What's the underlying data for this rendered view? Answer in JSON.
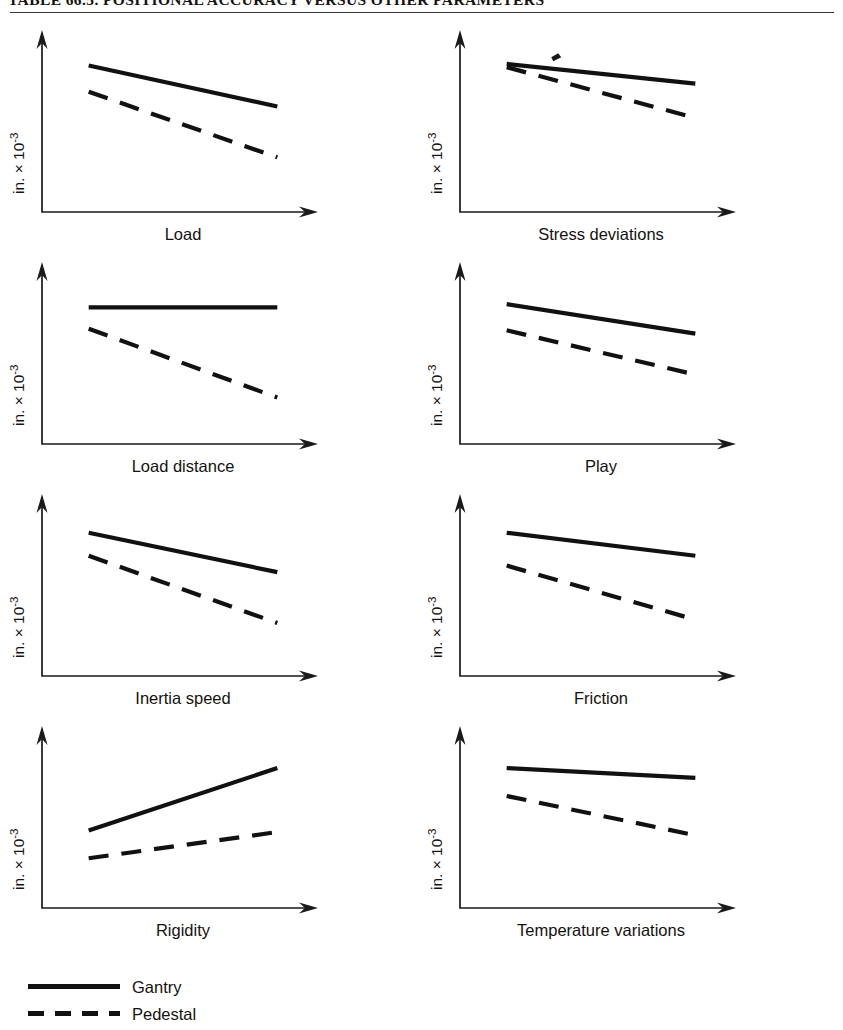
{
  "title": "TABLE 66.5.  POSITIONAL ACCURACY VERSUS OTHER PARAMETERS",
  "axis": {
    "ylabel": "in. × 10",
    "ylabel_exponent": "-3"
  },
  "legend": {
    "items": [
      {
        "label": "Gantry",
        "style": "solid",
        "swatch": "solid-line-swatch"
      },
      {
        "label": "Pedestal",
        "style": "dashed",
        "swatch": "dashed-line-swatch"
      }
    ]
  },
  "chart_data": [
    {
      "type": "line",
      "title": "Load",
      "xlabel": "Load",
      "ylabel": "in. × 10^-3",
      "xlim": [
        0,
        100
      ],
      "ylim": [
        0,
        100
      ],
      "grid": false,
      "legend_position": "below-figure",
      "series": [
        {
          "name": "Gantry",
          "style": "solid",
          "x": [
            14,
            86
          ],
          "y": [
            82,
            57
          ]
        },
        {
          "name": "Pedestal",
          "style": "dashed",
          "x": [
            14,
            86
          ],
          "y": [
            66,
            26
          ]
        }
      ]
    },
    {
      "type": "line",
      "title": "Stress deviations",
      "xlabel": "Stress deviations",
      "ylabel": "in. × 10^-3",
      "xlim": [
        0,
        100
      ],
      "ylim": [
        0,
        100
      ],
      "grid": false,
      "legend_position": "below-figure",
      "annotations": [
        {
          "type": "ink-smudge",
          "x": 31,
          "y": 87
        }
      ],
      "series": [
        {
          "name": "Gantry",
          "style": "solid",
          "x": [
            14,
            86
          ],
          "y": [
            83,
            71
          ]
        },
        {
          "name": "Pedestal",
          "style": "dashed",
          "x": [
            14,
            86
          ],
          "y": [
            81,
            50
          ]
        }
      ]
    },
    {
      "type": "line",
      "title": "Load distance",
      "xlabel": "Load distance",
      "ylabel": "in. × 10^-3",
      "xlim": [
        0,
        100
      ],
      "ylim": [
        0,
        100
      ],
      "grid": false,
      "legend_position": "below-figure",
      "series": [
        {
          "name": "Gantry",
          "style": "solid",
          "x": [
            14,
            86
          ],
          "y": [
            76,
            76
          ]
        },
        {
          "name": "Pedestal",
          "style": "dashed",
          "x": [
            14,
            86
          ],
          "y": [
            63,
            21
          ]
        }
      ]
    },
    {
      "type": "line",
      "title": "Play",
      "xlabel": "Play",
      "ylabel": "in. × 10^-3",
      "xlim": [
        0,
        100
      ],
      "ylim": [
        0,
        100
      ],
      "grid": false,
      "legend_position": "below-figure",
      "series": [
        {
          "name": "Gantry",
          "style": "solid",
          "x": [
            14,
            86
          ],
          "y": [
            78,
            60
          ]
        },
        {
          "name": "Pedestal",
          "style": "dashed",
          "x": [
            14,
            86
          ],
          "y": [
            62,
            35
          ]
        }
      ]
    },
    {
      "type": "line",
      "title": "Inertia speed",
      "xlabel": "Inertia speed",
      "ylabel": "in. × 10^-3",
      "xlim": [
        0,
        100
      ],
      "ylim": [
        0,
        100
      ],
      "grid": false,
      "legend_position": "below-figure",
      "series": [
        {
          "name": "Gantry",
          "style": "solid",
          "x": [
            14,
            86
          ],
          "y": [
            80,
            56
          ]
        },
        {
          "name": "Pedestal",
          "style": "dashed",
          "x": [
            14,
            86
          ],
          "y": [
            66,
            25
          ]
        }
      ]
    },
    {
      "type": "line",
      "title": "Friction",
      "xlabel": "Friction",
      "ylabel": "in. × 10^-3",
      "xlim": [
        0,
        100
      ],
      "ylim": [
        0,
        100
      ],
      "grid": false,
      "legend_position": "below-figure",
      "series": [
        {
          "name": "Gantry",
          "style": "solid",
          "x": [
            14,
            86
          ],
          "y": [
            80,
            66
          ]
        },
        {
          "name": "Pedestal",
          "style": "dashed",
          "x": [
            14,
            86
          ],
          "y": [
            60,
            27
          ]
        }
      ]
    },
    {
      "type": "line",
      "title": "Rigidity",
      "xlabel": "Rigidity",
      "ylabel": "in. × 10^-3",
      "xlim": [
        0,
        100
      ],
      "ylim": [
        0,
        100
      ],
      "grid": false,
      "legend_position": "below-figure",
      "series": [
        {
          "name": "Gantry",
          "style": "solid",
          "x": [
            14,
            86
          ],
          "y": [
            40,
            78
          ]
        },
        {
          "name": "Pedestal",
          "style": "dashed",
          "x": [
            14,
            86
          ],
          "y": [
            23,
            39
          ]
        }
      ]
    },
    {
      "type": "line",
      "title": "Temperature variations",
      "xlabel": "Temperature variations",
      "ylabel": "in. × 10^-3",
      "xlim": [
        0,
        100
      ],
      "ylim": [
        0,
        100
      ],
      "grid": false,
      "legend_position": "below-figure",
      "series": [
        {
          "name": "Gantry",
          "style": "solid",
          "x": [
            14,
            86
          ],
          "y": [
            78,
            72
          ]
        },
        {
          "name": "Pedestal",
          "style": "dashed",
          "x": [
            14,
            86
          ],
          "y": [
            61,
            37
          ]
        }
      ]
    }
  ]
}
